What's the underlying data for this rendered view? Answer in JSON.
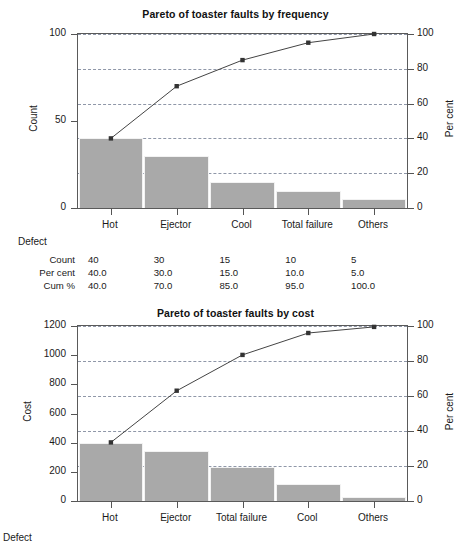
{
  "charts": [
    {
      "id": "frequency",
      "title": "Pareto of toaster faults by frequency",
      "ylabel": "Count",
      "y2label": "Per cent",
      "xlabel": "Defect",
      "categories": [
        "Hot",
        "Ejector",
        "Cool",
        "Total failure",
        "Others"
      ],
      "values": [
        40,
        30,
        15,
        10,
        5
      ],
      "cumulative": [
        40.0,
        70.0,
        85.0,
        95.0,
        100.0
      ],
      "yticks": [
        "0",
        "50",
        "100"
      ],
      "ytickvals": [
        0,
        50,
        100
      ],
      "ylim": [
        0,
        100
      ],
      "y2ticks": [
        "0",
        "20",
        "40",
        "60",
        "80",
        "100"
      ],
      "y2tickvals": [
        0,
        20,
        40,
        60,
        80,
        100
      ],
      "y2lim": [
        0,
        100
      ],
      "gridvals": [
        0,
        20,
        40,
        60,
        80,
        100
      ],
      "table": {
        "rows": [
          {
            "label": "Count",
            "cells": [
              "40",
              "30",
              "15",
              "10",
              "5"
            ]
          },
          {
            "label": "Per cent",
            "cells": [
              "40.0",
              "30.0",
              "15.0",
              "10.0",
              "5.0"
            ]
          },
          {
            "label": "Cum %",
            "cells": [
              "40.0",
              "70.0",
              "85.0",
              "95.0",
              "100.0"
            ]
          }
        ]
      }
    },
    {
      "id": "cost",
      "title": "Pareto of toaster faults by cost",
      "ylabel": "Cost",
      "y2label": "Per cent",
      "xlabel": "Defect",
      "categories": [
        "Hot",
        "Ejector",
        "Total failure",
        "Cool",
        "Others"
      ],
      "values": [
        400,
        340,
        230,
        115,
        30
      ],
      "cumulative": [
        33.5,
        63.0,
        83.5,
        96.0,
        99.5
      ],
      "yticks": [
        "0",
        "200",
        "400",
        "600",
        "800",
        "1000",
        "1200"
      ],
      "ytickvals": [
        0,
        200,
        400,
        600,
        800,
        1000,
        1200
      ],
      "ylim": [
        0,
        1200
      ],
      "y2ticks": [
        "0",
        "20",
        "40",
        "60",
        "80",
        "100"
      ],
      "y2tickvals": [
        0,
        20,
        40,
        60,
        80,
        100
      ],
      "y2lim": [
        0,
        100
      ],
      "gridvals": [
        0,
        20,
        40,
        60,
        80,
        100
      ],
      "table": null
    }
  ],
  "chart_data": [
    {
      "type": "bar",
      "title": "Pareto of toaster faults by frequency",
      "xlabel": "Defect",
      "ylabel": "Count",
      "y2label": "Per cent",
      "categories": [
        "Hot",
        "Ejector",
        "Cool",
        "Total failure",
        "Others"
      ],
      "values": [
        40,
        30,
        15,
        10,
        5
      ],
      "series": [
        {
          "name": "Count",
          "values": [
            40,
            30,
            15,
            10,
            5
          ],
          "axis": "left"
        },
        {
          "name": "Cum %",
          "values": [
            40.0,
            70.0,
            85.0,
            95.0,
            100.0
          ],
          "axis": "right",
          "type": "line"
        }
      ],
      "ylim": [
        0,
        100
      ],
      "y2lim": [
        0,
        100
      ],
      "yticks": [
        0,
        50,
        100
      ],
      "y2ticks": [
        0,
        20,
        40,
        60,
        80,
        100
      ],
      "grid": true,
      "legend": "none",
      "table": {
        "columns": [
          "Hot",
          "Ejector",
          "Cool",
          "Total failure",
          "Others"
        ],
        "rows": [
          {
            "label": "Count",
            "values": [
              40,
              30,
              15,
              10,
              5
            ]
          },
          {
            "label": "Per cent",
            "values": [
              40.0,
              30.0,
              15.0,
              10.0,
              5.0
            ]
          },
          {
            "label": "Cum %",
            "values": [
              40.0,
              70.0,
              85.0,
              95.0,
              100.0
            ]
          }
        ]
      }
    },
    {
      "type": "bar",
      "title": "Pareto of toaster faults by cost",
      "xlabel": "Defect",
      "ylabel": "Cost",
      "y2label": "Per cent",
      "categories": [
        "Hot",
        "Ejector",
        "Total failure",
        "Cool",
        "Others"
      ],
      "values": [
        400,
        340,
        230,
        115,
        30
      ],
      "series": [
        {
          "name": "Cost",
          "values": [
            400,
            340,
            230,
            115,
            30
          ],
          "axis": "left"
        },
        {
          "name": "Cum %",
          "values": [
            33.5,
            63.0,
            83.5,
            96.0,
            99.5
          ],
          "axis": "right",
          "type": "line"
        }
      ],
      "ylim": [
        0,
        1200
      ],
      "y2lim": [
        0,
        100
      ],
      "yticks": [
        0,
        200,
        400,
        600,
        800,
        1000,
        1200
      ],
      "y2ticks": [
        0,
        20,
        40,
        60,
        80,
        100
      ],
      "grid": true,
      "legend": "none"
    }
  ]
}
